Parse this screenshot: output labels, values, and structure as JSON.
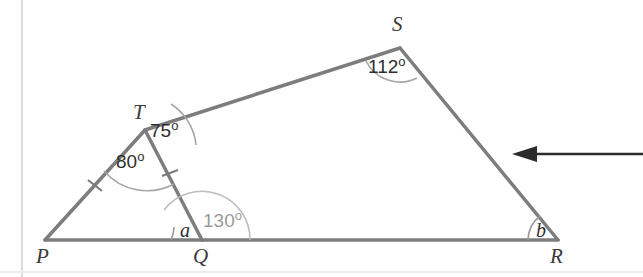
{
  "figure": {
    "stroke_color": "#7d7d7d",
    "arc_color": "#9a9a9a",
    "faint_rule_color": "#dcdcdc",
    "arrow_color": "#2b2b2b",
    "label_color": "#2e2e2e",
    "faint_label_color": "#9b9b9b",
    "vertices": [
      {
        "name": "P",
        "label": "P",
        "x": 45,
        "y": 240
      },
      {
        "name": "Q",
        "label": "Q",
        "x": 202,
        "y": 240
      },
      {
        "name": "R",
        "label": "R",
        "x": 558,
        "y": 240
      },
      {
        "name": "S",
        "label": "S",
        "x": 400,
        "y": 48
      },
      {
        "name": "T",
        "label": "T",
        "x": 145,
        "y": 130
      }
    ],
    "vertex_label_positions": [
      {
        "name": "P",
        "label": "P",
        "x": 36,
        "y": 246
      },
      {
        "name": "Q",
        "label": "Q",
        "x": 193,
        "y": 246
      },
      {
        "name": "R",
        "label": "R",
        "x": 550,
        "y": 246
      },
      {
        "name": "S",
        "label": "S",
        "x": 392,
        "y": 14
      },
      {
        "name": "T",
        "label": "T",
        "x": 133,
        "y": 102
      }
    ],
    "segments": [
      {
        "name": "segment-PQ",
        "from": "P",
        "to": "Q"
      },
      {
        "name": "segment-QR",
        "from": "Q",
        "to": "R"
      },
      {
        "name": "segment-RS",
        "from": "R",
        "to": "S"
      },
      {
        "name": "segment-ST",
        "from": "S",
        "to": "T"
      },
      {
        "name": "segment-TP",
        "from": "T",
        "to": "P"
      },
      {
        "name": "segment-TQ",
        "from": "T",
        "to": "Q"
      }
    ],
    "tick_marks": [
      {
        "name": "tick-PT",
        "segment": "TP",
        "count": 1
      },
      {
        "name": "tick-TQ",
        "segment": "TQ",
        "count": 1
      }
    ],
    "angles": [
      {
        "name": "angle-S",
        "vertex": "S",
        "label": "112",
        "unit": "o",
        "value": 112,
        "faint": false,
        "label_x": 368,
        "label_y": 55
      },
      {
        "name": "angle-T-upper",
        "vertex": "T",
        "label": "75",
        "unit": "o",
        "value": 75,
        "faint": false,
        "label_x": 150,
        "label_y": 119
      },
      {
        "name": "angle-T-lower",
        "vertex": "T",
        "label": "80",
        "unit": "o",
        "value": 80,
        "faint": false,
        "label_x": 116,
        "label_y": 150
      },
      {
        "name": "angle-Q-right",
        "vertex": "Q",
        "label": "130",
        "unit": "o",
        "value": 130,
        "faint": true,
        "label_x": 203,
        "label_y": 209
      },
      {
        "name": "angle-Q-left",
        "vertex": "Q",
        "label": "a",
        "unit": "",
        "value": null,
        "faint": false,
        "label_x": 180,
        "label_y": 220
      },
      {
        "name": "angle-R",
        "vertex": "R",
        "label": "b",
        "unit": "",
        "value": null,
        "faint": false,
        "label_x": 536,
        "label_y": 220
      }
    ],
    "annotation_arrow": {
      "name": "pointer-arrow",
      "direction": "left",
      "x_tip": 512,
      "x_tail": 643,
      "y": 154
    },
    "margin_rules": [
      {
        "name": "left-margin-rule",
        "orientation": "vertical",
        "x": 22
      },
      {
        "name": "bottom-margin-rule",
        "orientation": "horizontal",
        "y": 272
      }
    ]
  }
}
